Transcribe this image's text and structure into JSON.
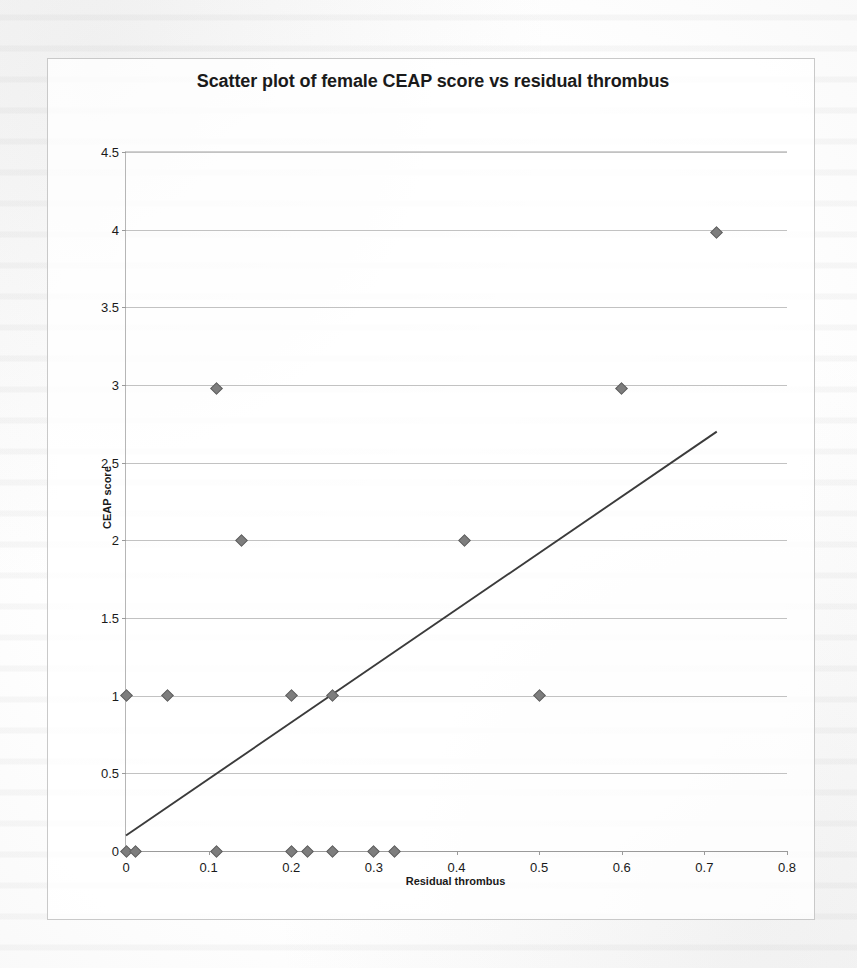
{
  "chart_data": {
    "type": "scatter",
    "title": "Scatter plot of female CEAP score vs residual thrombus",
    "xlabel": "Residual thrombus",
    "ylabel": "CEAP score",
    "xlim": [
      0,
      0.8
    ],
    "ylim": [
      0,
      4.5
    ],
    "grid": true,
    "legend": "none",
    "x_ticks": [
      "0",
      "0.1",
      "0.2",
      "0.3",
      "0.4",
      "0.5",
      "0.6",
      "0.7",
      "0.8"
    ],
    "x_tick_values": [
      0,
      0.1,
      0.2,
      0.3,
      0.4,
      0.5,
      0.6,
      0.7,
      0.8
    ],
    "y_ticks": [
      "0",
      "0.5",
      "1",
      "1.5",
      "2",
      "2.5",
      "3",
      "3.5",
      "4",
      "4.5"
    ],
    "y_tick_values": [
      0,
      0.5,
      1,
      1.5,
      2,
      2.5,
      3,
      3.5,
      4,
      4.5
    ],
    "series": [
      {
        "name": "Female CEAP score",
        "marker": "diamond",
        "color": "#7d7d7d",
        "points": [
          [
            0.0,
            0.0
          ],
          [
            0.012,
            0.0
          ],
          [
            0.11,
            0.0
          ],
          [
            0.2,
            0.0
          ],
          [
            0.22,
            0.0
          ],
          [
            0.25,
            0.0
          ],
          [
            0.3,
            0.0
          ],
          [
            0.325,
            0.0
          ],
          [
            0.0,
            1.0
          ],
          [
            0.05,
            1.0
          ],
          [
            0.2,
            1.0
          ],
          [
            0.25,
            1.0
          ],
          [
            0.5,
            1.0
          ],
          [
            0.14,
            2.0
          ],
          [
            0.41,
            2.0
          ],
          [
            0.11,
            2.98
          ],
          [
            0.6,
            2.98
          ],
          [
            0.715,
            3.98
          ]
        ]
      }
    ],
    "trendline": {
      "name": "Linear trendline",
      "color": "#3b3b3b",
      "x_start": 0.0,
      "y_start": 0.1,
      "x_end": 0.715,
      "y_end": 2.7
    }
  }
}
